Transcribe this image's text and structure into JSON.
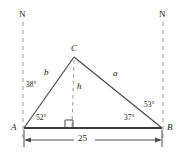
{
  "figure": {
    "type": "triangle-bearing-diagram",
    "stroke_color": "#3f3f3f",
    "dashed_color": "#9a9a9a",
    "text_color": "#1a1a1a"
  },
  "north_markers": [
    {
      "label": "N",
      "side": "left"
    },
    {
      "label": "N",
      "side": "right"
    }
  ],
  "vertices": [
    {
      "id": "A",
      "label": "A",
      "x": 24,
      "y": 128
    },
    {
      "id": "B",
      "label": "B",
      "x": 162,
      "y": 128
    },
    {
      "id": "C",
      "label": "C",
      "x": 74,
      "y": 57
    }
  ],
  "sides": [
    {
      "id": "b",
      "label": "b",
      "from": "A",
      "to": "C"
    },
    {
      "id": "a",
      "label": "a",
      "from": "C",
      "to": "B"
    },
    {
      "id": "h",
      "label": "h",
      "from": "C",
      "to": "foot",
      "style": "dashed"
    }
  ],
  "angles": [
    {
      "id": "bearing-left",
      "label": "38°",
      "value": 38,
      "at": "A",
      "kind": "bearing-from-north"
    },
    {
      "id": "interior-A",
      "label": "52°",
      "value": 52,
      "at": "A",
      "kind": "interior"
    },
    {
      "id": "interior-B",
      "label": "37°",
      "value": 37,
      "at": "B",
      "kind": "interior"
    },
    {
      "id": "bearing-right",
      "label": "53°",
      "value": 53,
      "at": "B",
      "kind": "bearing-from-north"
    }
  ],
  "right_angle": {
    "label": "right-angle-marker",
    "at": "foot-of-altitude"
  },
  "dimension": {
    "label": "25",
    "value": 25,
    "from": "A",
    "to": "B"
  }
}
